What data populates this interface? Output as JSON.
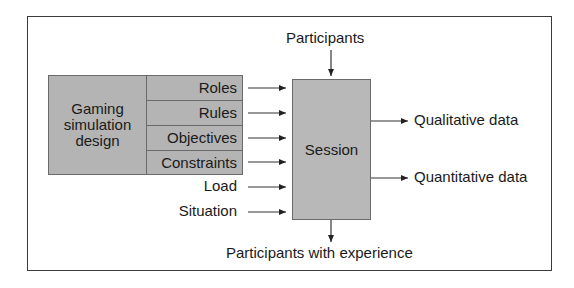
{
  "diagram": {
    "design_block": {
      "label": "Gaming simulation design",
      "label_lines": [
        "Gaming",
        "simulation",
        "design"
      ],
      "components": [
        "Roles",
        "Rules",
        "Objectives",
        "Constraints"
      ]
    },
    "other_inputs": [
      "Load",
      "Situation"
    ],
    "top_input": "Participants",
    "process": "Session",
    "outputs": [
      "Qualitative data",
      "Quantitative data"
    ],
    "bottom_output": "Participants with experience",
    "colors": {
      "box_fill": "#b4b4b4",
      "border": "#3a3a3a",
      "background": "#ffffff"
    }
  }
}
